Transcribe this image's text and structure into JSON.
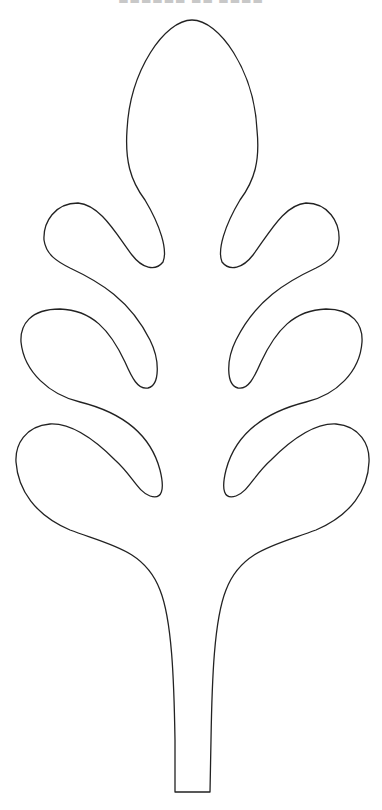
{
  "page": {
    "caption": "▬▬▬▬▬▬ ▬▬ ▬▬▬▬"
  },
  "figure": {
    "stroke_color": "#222222",
    "fill_color": "#ffffff",
    "background": "#ffffff"
  }
}
